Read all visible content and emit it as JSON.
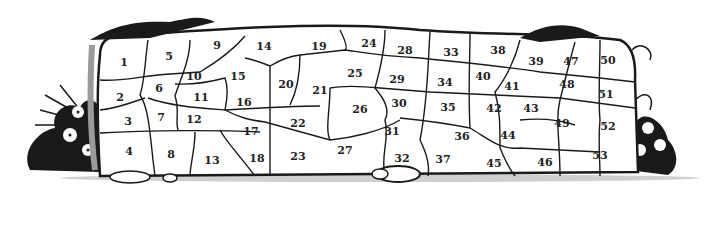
{
  "illustration": {
    "subject": "stone-wall-with-numbered-stones",
    "colors": {
      "ink": "#1a1a1a",
      "shade": "#9a9a9a",
      "stone": "#ffffff"
    },
    "stones": [
      {
        "n": "1",
        "x": 124,
        "y": 62
      },
      {
        "n": "2",
        "x": 120,
        "y": 97
      },
      {
        "n": "3",
        "x": 128,
        "y": 121
      },
      {
        "n": "4",
        "x": 129,
        "y": 151
      },
      {
        "n": "5",
        "x": 169,
        "y": 56
      },
      {
        "n": "6",
        "x": 159,
        "y": 88
      },
      {
        "n": "7",
        "x": 161,
        "y": 117
      },
      {
        "n": "8",
        "x": 171,
        "y": 154
      },
      {
        "n": "9",
        "x": 217,
        "y": 45
      },
      {
        "n": "10",
        "x": 194,
        "y": 76
      },
      {
        "n": "11",
        "x": 201,
        "y": 97
      },
      {
        "n": "12",
        "x": 194,
        "y": 119
      },
      {
        "n": "13",
        "x": 212,
        "y": 160
      },
      {
        "n": "14",
        "x": 264,
        "y": 46
      },
      {
        "n": "15",
        "x": 238,
        "y": 76
      },
      {
        "n": "16",
        "x": 244,
        "y": 102
      },
      {
        "n": "17",
        "x": 251,
        "y": 131
      },
      {
        "n": "18",
        "x": 257,
        "y": 158
      },
      {
        "n": "19",
        "x": 319,
        "y": 46
      },
      {
        "n": "20",
        "x": 286,
        "y": 84
      },
      {
        "n": "21",
        "x": 320,
        "y": 90
      },
      {
        "n": "22",
        "x": 298,
        "y": 123
      },
      {
        "n": "23",
        "x": 298,
        "y": 156
      },
      {
        "n": "24",
        "x": 369,
        "y": 43
      },
      {
        "n": "25",
        "x": 355,
        "y": 73
      },
      {
        "n": "26",
        "x": 360,
        "y": 109
      },
      {
        "n": "27",
        "x": 345,
        "y": 150
      },
      {
        "n": "28",
        "x": 405,
        "y": 50
      },
      {
        "n": "29",
        "x": 397,
        "y": 79
      },
      {
        "n": "30",
        "x": 399,
        "y": 103
      },
      {
        "n": "31",
        "x": 392,
        "y": 131
      },
      {
        "n": "32",
        "x": 402,
        "y": 158
      },
      {
        "n": "33",
        "x": 451,
        "y": 52
      },
      {
        "n": "34",
        "x": 445,
        "y": 82
      },
      {
        "n": "35",
        "x": 448,
        "y": 107
      },
      {
        "n": "36",
        "x": 462,
        "y": 136
      },
      {
        "n": "37",
        "x": 443,
        "y": 159
      },
      {
        "n": "38",
        "x": 498,
        "y": 50
      },
      {
        "n": "39",
        "x": 536,
        "y": 61
      },
      {
        "n": "40",
        "x": 483,
        "y": 76
      },
      {
        "n": "41",
        "x": 512,
        "y": 86
      },
      {
        "n": "42",
        "x": 494,
        "y": 108
      },
      {
        "n": "43",
        "x": 531,
        "y": 108
      },
      {
        "n": "44",
        "x": 508,
        "y": 135
      },
      {
        "n": "45",
        "x": 494,
        "y": 163
      },
      {
        "n": "46",
        "x": 545,
        "y": 162
      },
      {
        "n": "47",
        "x": 571,
        "y": 61
      },
      {
        "n": "48",
        "x": 567,
        "y": 84
      },
      {
        "n": "49",
        "x": 562,
        "y": 123
      },
      {
        "n": "50",
        "x": 608,
        "y": 60
      },
      {
        "n": "51",
        "x": 606,
        "y": 94
      },
      {
        "n": "52",
        "x": 608,
        "y": 126
      },
      {
        "n": "53",
        "x": 600,
        "y": 155
      }
    ]
  }
}
